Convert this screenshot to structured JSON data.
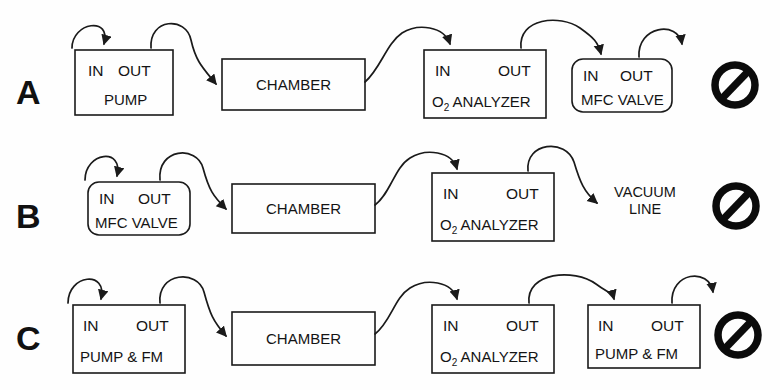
{
  "figure": {
    "type": "diagram",
    "subtype": "process-flow-gas-plumbing",
    "background_color": "#fefefe",
    "line_color": "#1a1a1a",
    "rows": [
      {
        "label": "A",
        "status_icon": "prohibition-icon",
        "status_meaning": "not-allowed",
        "nodes": [
          {
            "id": "pump",
            "in_label": "IN",
            "out_label": "OUT",
            "name": "PUMP",
            "shape": "rect"
          },
          {
            "id": "chamber",
            "name": "CHAMBER",
            "shape": "rect"
          },
          {
            "id": "o2",
            "in_label": "IN",
            "out_label": "OUT",
            "name": "O2 ANALYZER",
            "name_prefix": "O",
            "name_sub": "2",
            "name_suffix": " ANALYZER",
            "shape": "rect"
          },
          {
            "id": "mfc",
            "in_label": "IN",
            "out_label": "OUT",
            "name": "MFC VALVE",
            "shape": "rounded-rect"
          }
        ]
      },
      {
        "label": "B",
        "status_icon": "prohibition-icon",
        "status_meaning": "not-allowed",
        "nodes": [
          {
            "id": "mfc",
            "in_label": "IN",
            "out_label": "OUT",
            "name": "MFC VALVE",
            "shape": "rounded-rect"
          },
          {
            "id": "chamber",
            "name": "CHAMBER",
            "shape": "rect"
          },
          {
            "id": "o2",
            "in_label": "IN",
            "out_label": "OUT",
            "name": "O2 ANALYZER",
            "name_prefix": "O",
            "name_sub": "2",
            "name_suffix": " ANALYZER",
            "shape": "rect"
          },
          {
            "id": "vacuum",
            "name_line1": "VACUUM",
            "name_line2": "LINE",
            "shape": "text-only"
          }
        ]
      },
      {
        "label": "C",
        "status_icon": "prohibition-icon",
        "status_meaning": "not-allowed",
        "nodes": [
          {
            "id": "pumpfm1",
            "in_label": "IN",
            "out_label": "OUT",
            "name": "PUMP & FM",
            "shape": "rect"
          },
          {
            "id": "chamber",
            "name": "CHAMBER",
            "shape": "rect"
          },
          {
            "id": "o2",
            "in_label": "IN",
            "out_label": "OUT",
            "name": "O2 ANALYZER",
            "name_prefix": "O",
            "name_sub": "2",
            "name_suffix": " ANALYZER",
            "shape": "rect"
          },
          {
            "id": "pumpfm2",
            "in_label": "IN",
            "out_label": "OUT",
            "name": "PUMP & FM",
            "shape": "rect"
          }
        ]
      }
    ]
  },
  "text": {
    "in": "IN",
    "out": "OUT",
    "pump": "PUMP",
    "pump_fm": "PUMP & FM",
    "chamber": "CHAMBER",
    "o2_prefix": "O",
    "o2_sub": "2",
    "o2_suffix": " ANALYZER",
    "mfc_valve": "MFC VALVE",
    "vacuum": "VACUUM",
    "line": "LINE",
    "label_a": "A",
    "label_b": "B",
    "label_c": "C"
  }
}
